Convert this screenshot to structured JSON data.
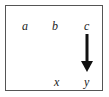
{
  "diagram": {
    "top_row": [
      "a",
      "b",
      "c"
    ],
    "bottom_row": [
      "x",
      "y"
    ],
    "arrow": {
      "from": "c",
      "to": "y",
      "direction": "down"
    },
    "colors": {
      "border": "#555555",
      "text": "#222222",
      "arrow": "#111111"
    }
  }
}
